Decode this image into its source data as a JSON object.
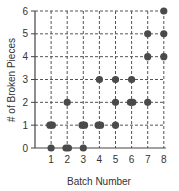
{
  "chart_data": {
    "type": "scatter",
    "title": "",
    "xlabel": "Batch Number",
    "ylabel": "# of Broken Pieces",
    "x_ticks": [
      1,
      2,
      3,
      4,
      5,
      6,
      7,
      8
    ],
    "y_ticks": [
      0,
      1,
      2,
      3,
      4,
      5,
      6
    ],
    "xlim": [
      0,
      8
    ],
    "ylim": [
      0,
      6
    ],
    "grid": true,
    "grid_style": "dashed",
    "point_color": "#4a4a4a",
    "points": [
      {
        "x": 1,
        "y": 0
      },
      {
        "x": 1,
        "y": 1
      },
      {
        "x": 1,
        "y": 1
      },
      {
        "x": 2,
        "y": 0
      },
      {
        "x": 2,
        "y": 0
      },
      {
        "x": 2,
        "y": 2
      },
      {
        "x": 3,
        "y": 0
      },
      {
        "x": 3,
        "y": 1
      },
      {
        "x": 3,
        "y": 1
      },
      {
        "x": 4,
        "y": 1
      },
      {
        "x": 4,
        "y": 1
      },
      {
        "x": 4,
        "y": 3
      },
      {
        "x": 5,
        "y": 1
      },
      {
        "x": 5,
        "y": 2
      },
      {
        "x": 5,
        "y": 3
      },
      {
        "x": 6,
        "y": 2
      },
      {
        "x": 6,
        "y": 2
      },
      {
        "x": 6,
        "y": 3
      },
      {
        "x": 7,
        "y": 2
      },
      {
        "x": 7,
        "y": 4
      },
      {
        "x": 7,
        "y": 5
      },
      {
        "x": 8,
        "y": 4
      },
      {
        "x": 8,
        "y": 5
      },
      {
        "x": 8,
        "y": 6
      }
    ]
  }
}
